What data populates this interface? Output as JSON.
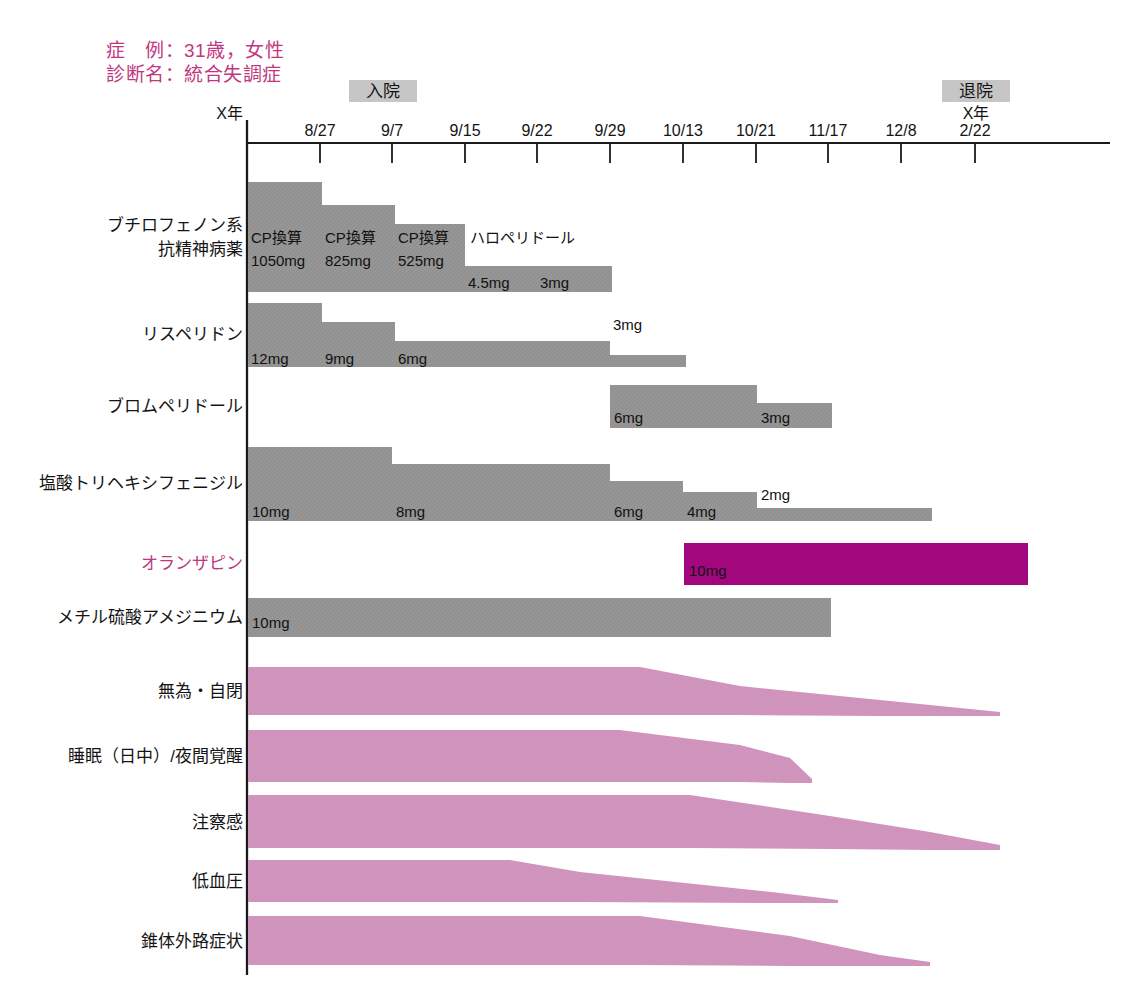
{
  "page": {
    "faint_header": "",
    "background": "#ffffff"
  },
  "case_info": {
    "line1": "症　例：31歳，女性",
    "line2": "診断名：統合失調症",
    "color": "#c0377f"
  },
  "events": {
    "admission": {
      "label": "入院",
      "x": 383
    },
    "discharge": {
      "label": "退院",
      "x": 976
    }
  },
  "axis": {
    "year_start_label": "X年",
    "year_end_label": "X年",
    "x_start": 247,
    "x_end": 1110,
    "y": 143,
    "ticks": [
      {
        "label": "8/27",
        "x": 320
      },
      {
        "label": "9/7",
        "x": 392
      },
      {
        "label": "9/15",
        "x": 465
      },
      {
        "label": "9/22",
        "x": 537
      },
      {
        "label": "9/29",
        "x": 610
      },
      {
        "label": "10/13",
        "x": 683
      },
      {
        "label": "10/21",
        "x": 756
      },
      {
        "label": "11/17",
        "x": 828
      },
      {
        "label": "12/8",
        "x": 901
      },
      {
        "label": "2/22",
        "x": 975
      }
    ]
  },
  "colors": {
    "grey_bar": "#969696",
    "grey_box": "#c6c6c6",
    "magenta_bar": "#a2077e",
    "pink_wedge": "#d196be",
    "accent_text": "#c0377f"
  },
  "chart_data": {
    "type": "timeline-gantt",
    "xlabel": "日付",
    "x_ticks": [
      "8/27",
      "9/7",
      "9/15",
      "9/22",
      "9/29",
      "10/13",
      "10/21",
      "11/17",
      "12/8",
      "2/22"
    ],
    "drug_rows": [
      {
        "label": "ブチロフェノン系\n抗精神病薬",
        "label_lines": [
          "ブチロフェノン系",
          "抗精神病薬"
        ],
        "color": "#969696",
        "segments": [
          {
            "name": "CP換算",
            "dose": "1050mg",
            "x0": 248,
            "x1": 322,
            "top": 182,
            "bottom": 292
          },
          {
            "name": "CP換算",
            "dose": "825mg",
            "x0": 322,
            "x1": 395,
            "top": 205,
            "bottom": 292
          },
          {
            "name": "CP換算",
            "dose": "525mg",
            "x0": 395,
            "x1": 465,
            "top": 224,
            "bottom": 292
          },
          {
            "name": "ハロペリドール",
            "dose": "4.5mg",
            "x0": 465,
            "x1": 537,
            "top": 266,
            "bottom": 292
          },
          {
            "name": "ハロペリドール",
            "dose": "3mg",
            "x0": 537,
            "x1": 612,
            "top": 266,
            "bottom": 292
          }
        ]
      },
      {
        "label": "リスペリドン",
        "label_lines": [
          "リスペリドン"
        ],
        "color": "#969696",
        "segments": [
          {
            "name": "リスペリドン",
            "dose": "12mg",
            "x0": 248,
            "x1": 322,
            "top": 303,
            "bottom": 367
          },
          {
            "name": "リスペリドン",
            "dose": "9mg",
            "x0": 322,
            "x1": 395,
            "top": 322,
            "bottom": 367
          },
          {
            "name": "リスペリドン",
            "dose": "6mg",
            "x0": 395,
            "x1": 610,
            "top": 341,
            "bottom": 367
          },
          {
            "name": "リスペリドン",
            "dose": "3mg",
            "x0": 610,
            "x1": 686,
            "top": 355,
            "bottom": 367
          }
        ]
      },
      {
        "label": "ブロムペリドール",
        "label_lines": [
          "ブロムペリドール"
        ],
        "color": "#969696",
        "segments": [
          {
            "name": "ブロムペリドール",
            "dose": "6mg",
            "x0": 610,
            "x1": 757,
            "top": 385,
            "bottom": 428
          },
          {
            "name": "ブロムペリドール",
            "dose": "3mg",
            "x0": 757,
            "x1": 832,
            "top": 403,
            "bottom": 428
          }
        ]
      },
      {
        "label": "塩酸トリヘキシフェニジル",
        "label_lines": [
          "塩酸トリヘキシフェニジル"
        ],
        "color": "#969696",
        "segments": [
          {
            "name": "塩酸トリヘキシフェニジル",
            "dose": "10mg",
            "x0": 248,
            "x1": 392,
            "top": 447,
            "bottom": 521
          },
          {
            "name": "塩酸トリヘキシフェニジル",
            "dose": "8mg",
            "x0": 392,
            "x1": 610,
            "top": 464,
            "bottom": 521
          },
          {
            "name": "塩酸トリヘキシフェニジル",
            "dose": "6mg",
            "x0": 610,
            "x1": 683,
            "top": 481,
            "bottom": 521
          },
          {
            "name": "塩酸トリヘキシフェニジル",
            "dose": "4mg",
            "x0": 683,
            "x1": 757,
            "top": 492,
            "bottom": 521
          },
          {
            "name": "塩酸トリヘキシフェニジル",
            "dose": "2mg",
            "x0": 757,
            "x1": 932,
            "top": 508,
            "bottom": 521
          }
        ]
      },
      {
        "label": "オランザピン",
        "label_lines": [
          "オランザピン"
        ],
        "color": "#a2077e",
        "accent": true,
        "segments": [
          {
            "name": "オランザピン",
            "dose": "10mg",
            "x0": 684,
            "x1": 1028,
            "top": 543,
            "bottom": 585
          }
        ]
      },
      {
        "label": "メチル硫酸アメジニウム",
        "label_lines": [
          "メチル硫酸アメジニウム"
        ],
        "color": "#969696",
        "segments": [
          {
            "name": "メチル硫酸アメジニウム",
            "dose": "10mg",
            "x0": 248,
            "x1": 831,
            "top": 598,
            "bottom": 637
          }
        ]
      }
    ],
    "symptom_rows": [
      {
        "label": "無為・自閉",
        "color": "#d196be",
        "y_top": 667,
        "y_bottom": 715,
        "taper": [
          {
            "x": 248,
            "top": 667,
            "bottom": 715
          },
          {
            "x": 640,
            "top": 667,
            "bottom": 715
          },
          {
            "x": 740,
            "top": 686,
            "bottom": 715
          },
          {
            "x": 880,
            "top": 700,
            "bottom": 716
          },
          {
            "x": 1000,
            "top": 712,
            "bottom": 716
          }
        ]
      },
      {
        "label": "睡眠（日中）/夜間覚醒",
        "color": "#d196be",
        "y_top": 730,
        "y_bottom": 782,
        "taper": [
          {
            "x": 248,
            "top": 730,
            "bottom": 782
          },
          {
            "x": 620,
            "top": 730,
            "bottom": 782
          },
          {
            "x": 740,
            "top": 745,
            "bottom": 782
          },
          {
            "x": 790,
            "top": 758,
            "bottom": 783
          },
          {
            "x": 812,
            "top": 779,
            "bottom": 783
          }
        ]
      },
      {
        "label": "注察感",
        "color": "#d196be",
        "y_top": 795,
        "y_bottom": 848,
        "taper": [
          {
            "x": 248,
            "top": 795,
            "bottom": 848
          },
          {
            "x": 690,
            "top": 795,
            "bottom": 848
          },
          {
            "x": 830,
            "top": 816,
            "bottom": 849
          },
          {
            "x": 930,
            "top": 832,
            "bottom": 850
          },
          {
            "x": 1000,
            "top": 845,
            "bottom": 850
          }
        ]
      },
      {
        "label": "低血圧",
        "color": "#d196be",
        "y_top": 860,
        "y_bottom": 902,
        "taper": [
          {
            "x": 248,
            "top": 860,
            "bottom": 902
          },
          {
            "x": 510,
            "top": 860,
            "bottom": 902
          },
          {
            "x": 580,
            "top": 872,
            "bottom": 902
          },
          {
            "x": 780,
            "top": 893,
            "bottom": 903
          },
          {
            "x": 838,
            "top": 900,
            "bottom": 903
          }
        ]
      },
      {
        "label": "錐体外路症状",
        "color": "#d196be",
        "y_top": 916,
        "y_bottom": 965,
        "taper": [
          {
            "x": 248,
            "top": 916,
            "bottom": 965
          },
          {
            "x": 640,
            "top": 916,
            "bottom": 965
          },
          {
            "x": 790,
            "top": 936,
            "bottom": 966
          },
          {
            "x": 880,
            "top": 955,
            "bottom": 966
          },
          {
            "x": 930,
            "top": 962,
            "bottom": 966
          }
        ]
      }
    ]
  }
}
